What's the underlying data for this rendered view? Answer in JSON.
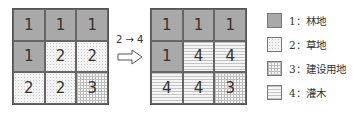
{
  "diagram": {
    "before_grid": {
      "cells": [
        {
          "value": "1",
          "type": "t1"
        },
        {
          "value": "1",
          "type": "t1"
        },
        {
          "value": "1",
          "type": "t1"
        },
        {
          "value": "1",
          "type": "t1"
        },
        {
          "value": "2",
          "type": "t2"
        },
        {
          "value": "2",
          "type": "t2"
        },
        {
          "value": "2",
          "type": "t2"
        },
        {
          "value": "2",
          "type": "t2"
        },
        {
          "value": "3",
          "type": "t3"
        }
      ]
    },
    "transition": {
      "label": "2 → 4",
      "icon": "hollow-right-arrow-icon"
    },
    "after_grid": {
      "cells": [
        {
          "value": "1",
          "type": "t1"
        },
        {
          "value": "1",
          "type": "t1"
        },
        {
          "value": "1",
          "type": "t1"
        },
        {
          "value": "1",
          "type": "t1"
        },
        {
          "value": "4",
          "type": "t4"
        },
        {
          "value": "4",
          "type": "t4"
        },
        {
          "value": "4",
          "type": "t4"
        },
        {
          "value": "4",
          "type": "t4"
        },
        {
          "value": "3",
          "type": "t3"
        }
      ]
    },
    "legend": [
      {
        "label": "1：林地",
        "type": "t1"
      },
      {
        "label": "2：草地",
        "type": "t2"
      },
      {
        "label": "3：建设用地",
        "type": "t3"
      },
      {
        "label": "4：灌木",
        "type": "t4"
      }
    ],
    "colors": {
      "forest_fill": "#a9a9a9",
      "border": "#666666",
      "text": "#333333"
    }
  }
}
